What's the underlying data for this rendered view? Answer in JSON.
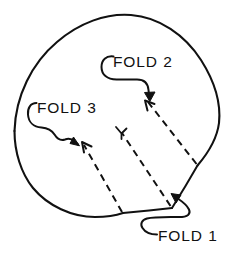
{
  "figure": {
    "background_color": "#ffffff",
    "ink_color": "#111111",
    "width": 246,
    "height": 254
  },
  "labels": {
    "fold_1": "FOLD 1",
    "fold_2": "FOLD 2",
    "fold_3": "FOLD 3"
  },
  "annotations": {
    "fold_1": {
      "label": "FOLD 1",
      "arrow_style": "curved-hook",
      "points_to": "bottom-vertex",
      "crease_type": "solid",
      "target_point": [
        172,
        208
      ]
    },
    "fold_2": {
      "label": "FOLD 2",
      "arrow_style": "curved-hook",
      "points_to": "upper-dashed-crease",
      "crease_type": "dashed",
      "target_point": [
        146,
        101
      ]
    },
    "fold_3": {
      "label": "FOLD 3",
      "arrow_style": "wavy-hook",
      "points_to": "left-dashed-crease",
      "crease_type": "dashed",
      "target_point": [
        82,
        143
      ]
    }
  },
  "creases": [
    {
      "name": "fold-1-crease-left",
      "type": "solid",
      "from": [
        123,
        213
      ],
      "to": [
        172,
        208
      ]
    },
    {
      "name": "fold-1-crease-right",
      "type": "solid",
      "from": [
        172,
        208
      ],
      "to": [
        197,
        166
      ]
    },
    {
      "name": "fold-2-crease",
      "type": "dashed",
      "from": [
        197,
        166
      ],
      "to": [
        146,
        101
      ]
    },
    {
      "name": "fold-3-crease",
      "type": "dashed",
      "from": [
        123,
        213
      ],
      "to": [
        82,
        143
      ]
    },
    {
      "name": "center-crease",
      "type": "dashed",
      "from": [
        172,
        208
      ],
      "to": [
        121,
        132
      ]
    }
  ]
}
